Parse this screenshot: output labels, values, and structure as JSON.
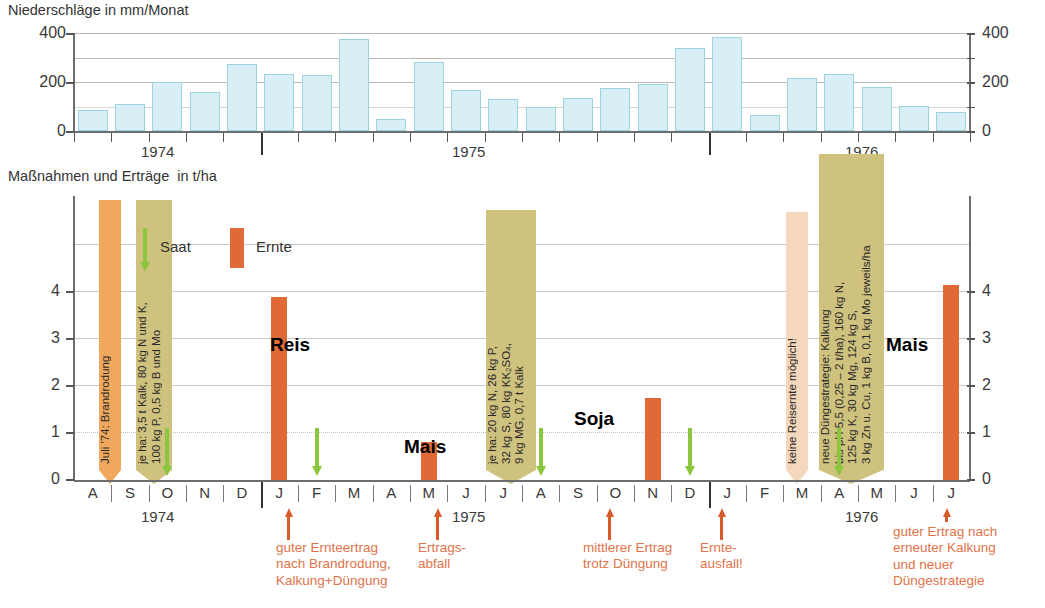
{
  "precip": {
    "title": "Niederschläge in mm/Monat",
    "y_ticks": [
      "400",
      "200",
      "0"
    ],
    "y_ticks_right": [
      "400",
      "200",
      "0"
    ]
  },
  "yield": {
    "title": "Maßnahmen und Erträge  in t/ha",
    "y_ticks": [
      "4",
      "3",
      "2",
      "1",
      "0"
    ],
    "y_ticks_right": [
      "4",
      "3",
      "2",
      "1",
      "0"
    ]
  },
  "legend": {
    "saat": "Saat",
    "ernte": "Ernte"
  },
  "years": [
    "1974",
    "1975",
    "1976"
  ],
  "months": [
    "A",
    "S",
    "O",
    "N",
    "D",
    "J",
    "F",
    "M",
    "A",
    "M",
    "J",
    "J",
    "A",
    "S",
    "O",
    "N",
    "D",
    "J",
    "F",
    "M",
    "A",
    "M",
    "J",
    "J"
  ],
  "crop_labels": [
    {
      "name": "Reis"
    },
    {
      "name": "Mais"
    },
    {
      "name": "Soja"
    },
    {
      "name": "Mais"
    }
  ],
  "banners": [
    {
      "id": "brandrodung",
      "lines": [
        "Juli '74: Brandrodung"
      ],
      "color": "#f0a95c"
    },
    {
      "id": "duengung-1974",
      "lines": [
        "je ha: 3,5 t Kalk, 80 kg N und K,",
        "100 kg P, 0,5 kg B und Mo"
      ],
      "color": "#cfc27e"
    },
    {
      "id": "duengung-1975",
      "lines": [
        "je ha: 20 kg N, 26 kg P,",
        "32 kg S, 80 kg KK₂SO₄,",
        "9 kg MG, 0,7 t Kalk"
      ],
      "color": "#cfc27e"
    },
    {
      "id": "keine-reisernte",
      "lines": [
        "keine Reisernte möglich!"
      ],
      "color": "#f5d7bb"
    },
    {
      "id": "neue-duengestrategie",
      "lines": [
        "neue Düngestrategie: Kalkung",
        "bis pH 5,5 (0,25 – 2 t/ha), 160 kg N,",
        "125 kg K, 30 kg Mg, 124 kg S,",
        "3 kg Zn u. Cu, 1 kg B, 0,1 kg Mo jeweils/ha"
      ],
      "color": "#cfc27e"
    }
  ],
  "callouts": [
    {
      "id": "callout-1",
      "lines": [
        "guter Ernteertrag",
        "nach Brandrodung,",
        "Kalkung+Düngung"
      ]
    },
    {
      "id": "callout-2",
      "lines": [
        "Ertrags-",
        "abfall"
      ]
    },
    {
      "id": "callout-3",
      "lines": [
        "mittlerer Ertrag",
        "trotz Düngung"
      ]
    },
    {
      "id": "callout-4",
      "lines": [
        "Ernte-",
        "ausfall!"
      ]
    },
    {
      "id": "callout-5",
      "lines": [
        "guter Ertrag nach",
        "erneuter Kalkung",
        "und neuer",
        "Düngestrategie"
      ]
    }
  ],
  "colors": {
    "precip_bar": "#d7eff5",
    "precip_bar_edge": "#9fd3e2",
    "harvest_bar": "#df6a35",
    "seed_arrow": "#8cc63f",
    "banner_tan": "#cfc27e",
    "banner_orange": "#f0a95c",
    "banner_pale": "#f5d7bb",
    "callout_text": "#e0734a"
  },
  "chart_data": [
    {
      "type": "bar",
      "title": "Niederschläge in mm/Monat",
      "ylabel": "mm/Monat",
      "xlabel": "",
      "ylim": [
        0,
        420
      ],
      "grid": true,
      "categories": [
        "1974-08",
        "1974-09",
        "1974-10",
        "1974-11",
        "1974-12",
        "1975-01",
        "1975-02",
        "1975-03",
        "1975-04",
        "1975-05",
        "1975-06",
        "1975-07",
        "1975-08",
        "1975-09",
        "1975-10",
        "1975-11",
        "1975-12",
        "1976-01",
        "1976-02",
        "1976-03",
        "1976-04",
        "1976-05",
        "1976-06",
        "1976-07"
      ],
      "month_letters": [
        "A",
        "S",
        "O",
        "N",
        "D",
        "J",
        "F",
        "M",
        "A",
        "M",
        "J",
        "J",
        "A",
        "S",
        "O",
        "N",
        "D",
        "J",
        "F",
        "M",
        "A",
        "M",
        "J",
        "J"
      ],
      "values": [
        85,
        110,
        200,
        160,
        272,
        232,
        230,
        375,
        50,
        280,
        168,
        132,
        100,
        133,
        175,
        192,
        338,
        385,
        65,
        215,
        232,
        178,
        102,
        78
      ],
      "tick_labels": [
        "0",
        "200",
        "400"
      ],
      "year_dividers": [
        "1974",
        "1975",
        "1976"
      ]
    },
    {
      "type": "bar",
      "title": "Maßnahmen und Erträge in t/ha",
      "ylabel": "t/ha",
      "xlabel": "",
      "ylim": [
        0,
        5.1
      ],
      "grid": true,
      "categories": [
        "1974-08",
        "1974-09",
        "1974-10",
        "1974-11",
        "1974-12",
        "1975-01",
        "1975-02",
        "1975-03",
        "1975-04",
        "1975-05",
        "1975-06",
        "1975-07",
        "1975-08",
        "1975-09",
        "1975-10",
        "1975-11",
        "1975-12",
        "1976-01",
        "1976-02",
        "1976-03",
        "1976-04",
        "1976-05",
        "1976-06",
        "1976-07"
      ],
      "tick_labels": [
        "0",
        "1",
        "2",
        "3",
        "4"
      ],
      "series": [
        {
          "name": "Ernte",
          "unit": "t/ha",
          "points": [
            {
              "month": "1975-01",
              "crop": "Reis",
              "value": 3.9
            },
            {
              "month": "1975-05",
              "crop": "Mais",
              "value": 0.8
            },
            {
              "month": "1975-11",
              "crop": "Soja",
              "value": 1.75
            },
            {
              "month": "1976-07",
              "crop": "Mais",
              "value": 4.15
            }
          ]
        },
        {
          "name": "Saat",
          "unit": "",
          "points": [
            {
              "month": "1974-10"
            },
            {
              "month": "1975-02"
            },
            {
              "month": "1975-08"
            },
            {
              "month": "1975-12"
            },
            {
              "month": "1976-04"
            }
          ]
        }
      ],
      "annotations": [
        {
          "at": "1974-08",
          "text": "Juli '74: Brandrodung"
        },
        {
          "at": "1974-09",
          "text": "je ha: 3,5 t Kalk, 80 kg N und K, 100 kg P, 0,5 kg B und Mo"
        },
        {
          "at": "1975-07",
          "text": "je ha: 20 kg N, 26 kg P, 32 kg S, 80 kg KK₂SO₄, 9 kg MG, 0,7 t Kalk"
        },
        {
          "at": "1976-01",
          "text": "keine Reisernte möglich!"
        },
        {
          "at": "1976-02",
          "text": "neue Düngestrategie: Kalkung bis pH 5,5 (0,25 – 2 t/ha), 160 kg N, 125 kg K, 30 kg Mg, 124 kg S, 3 kg Zn u. Cu, 1 kg B, 0,1 kg Mo jeweils/ha"
        },
        {
          "at": "1975-01",
          "text": "guter Ernteertrag nach Brandrodung, Kalkung+Düngung"
        },
        {
          "at": "1975-05",
          "text": "Ertrags-abfall"
        },
        {
          "at": "1975-11",
          "text": "mittlerer Ertrag trotz Düngung"
        },
        {
          "at": "1976-01",
          "text": "Ernte-ausfall!"
        },
        {
          "at": "1976-07",
          "text": "guter Ertrag nach erneuter Kalkung und neuer Düngestrategie"
        }
      ]
    }
  ]
}
